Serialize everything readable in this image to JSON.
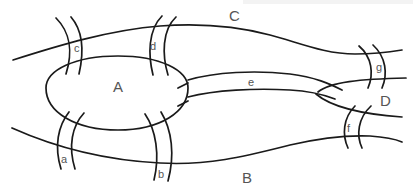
{
  "diagram": {
    "regions": [
      {
        "id": "A",
        "label": "A",
        "x": 118,
        "y": 92
      },
      {
        "id": "B",
        "label": "B",
        "x": 247,
        "y": 183
      },
      {
        "id": "C",
        "label": "C",
        "x": 234,
        "y": 21
      },
      {
        "id": "D",
        "label": "D",
        "x": 384,
        "y": 105
      }
    ],
    "bridges": [
      {
        "id": "a",
        "label": "a",
        "connects": [
          "A",
          "B"
        ],
        "x": 64,
        "y": 163
      },
      {
        "id": "b",
        "label": "b",
        "connects": [
          "A",
          "B"
        ],
        "x": 161,
        "y": 178
      },
      {
        "id": "c",
        "label": "c",
        "connects": [
          "A",
          "C"
        ],
        "x": 77,
        "y": 52
      },
      {
        "id": "d",
        "label": "d",
        "connects": [
          "A",
          "C"
        ],
        "x": 154,
        "y": 50
      },
      {
        "id": "e",
        "label": "e",
        "connects": [
          "A",
          "D"
        ],
        "x": 251,
        "y": 86
      },
      {
        "id": "f",
        "label": "f",
        "connects": [
          "B",
          "D"
        ],
        "x": 349,
        "y": 132
      },
      {
        "id": "g",
        "label": "g",
        "connects": [
          "C",
          "D"
        ],
        "x": 380,
        "y": 71
      }
    ]
  }
}
